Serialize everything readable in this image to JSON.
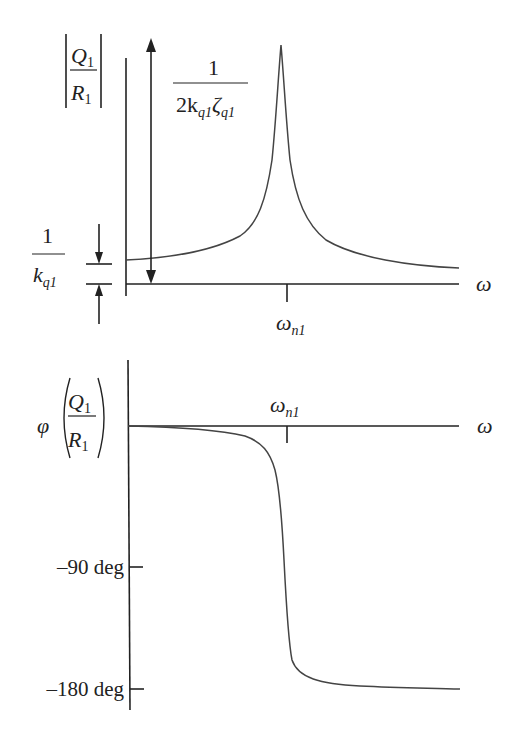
{
  "figure": {
    "type": "frequency-response-sketch",
    "magnitude_plot": {
      "y_label_num": "Q",
      "y_label_num_sub": "1",
      "y_label_den": "R",
      "y_label_den_sub": "1",
      "x_label": "ω",
      "tick_label": "ω",
      "tick_label_sub": "n1",
      "static_gain_label_num": "1",
      "static_gain_label_den": "k",
      "static_gain_label_den_sub": "q1",
      "peak_label_num": "1",
      "peak_label_den_prefix": "2k",
      "peak_label_den_sub1": "q1",
      "peak_label_den_zeta": "ζ",
      "peak_label_den_sub2": "q1"
    },
    "phase_plot": {
      "y_label_phi": "φ",
      "y_label_num": "Q",
      "y_label_num_sub": "1",
      "y_label_den": "R",
      "y_label_den_sub": "1",
      "x_label": "ω",
      "tick_label": "ω",
      "tick_label_sub": "n1",
      "y_ticks": [
        "–90 deg",
        "–180 deg"
      ]
    },
    "colors": {
      "line": "#222222",
      "curve": "#444444",
      "background": "#ffffff"
    }
  }
}
